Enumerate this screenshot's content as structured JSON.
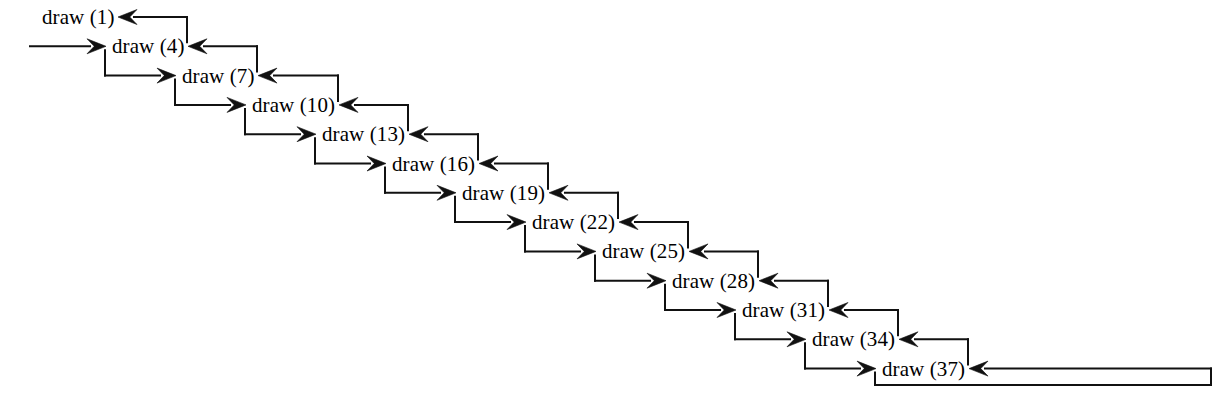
{
  "diagram": {
    "type": "recursion-trace-diagram",
    "background_color": "#ffffff",
    "line_color": "#111111",
    "text_color": "#000000",
    "font_size_px": 21,
    "layout": {
      "start_x": 42,
      "start_y": 17,
      "step_x": 70,
      "step_y": 29.3,
      "label_width": 66,
      "arrow_gap": 14
    },
    "entry_arrow": {
      "name": "program-entry-arrow",
      "from_x": 30,
      "target_node_index": 1,
      "description": "initial call entering draw (4) row"
    },
    "terminal_loop": {
      "name": "base-case-return-loop",
      "node_index": 12,
      "right_extent_x": 1211,
      "bottom_y": 385,
      "description": "loop from draw (37) down, right, up and back as return arrow"
    },
    "nodes": [
      {
        "id": "node-0",
        "label": "draw (1)",
        "arg": 1,
        "row": 0
      },
      {
        "id": "node-1",
        "label": "draw (4)",
        "arg": 4,
        "row": 1
      },
      {
        "id": "node-2",
        "label": "draw (7)",
        "arg": 7,
        "row": 2
      },
      {
        "id": "node-3",
        "label": "draw (10)",
        "arg": 10,
        "row": 3
      },
      {
        "id": "node-4",
        "label": "draw (13)",
        "arg": 13,
        "row": 4
      },
      {
        "id": "node-5",
        "label": "draw (16)",
        "arg": 16,
        "row": 5
      },
      {
        "id": "node-6",
        "label": "draw (19)",
        "arg": 19,
        "row": 6
      },
      {
        "id": "node-7",
        "label": "draw (22)",
        "arg": 22,
        "row": 7
      },
      {
        "id": "node-8",
        "label": "draw (25)",
        "arg": 25,
        "row": 8
      },
      {
        "id": "node-9",
        "label": "draw (28)",
        "arg": 28,
        "row": 9
      },
      {
        "id": "node-10",
        "label": "draw (31)",
        "arg": 31,
        "row": 10
      },
      {
        "id": "node-11",
        "label": "draw (34)",
        "arg": 34,
        "row": 11
      },
      {
        "id": "node-12",
        "label": "draw (37)",
        "arg": 37,
        "row": 12
      }
    ]
  }
}
